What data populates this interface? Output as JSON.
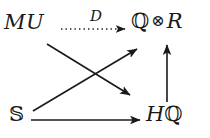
{
  "diagram": {
    "type": "commutative-diagram",
    "background_color": "#ffffff",
    "ink_color": "#1a1a1a",
    "nodes": [
      {
        "id": "mu",
        "label": "MU",
        "position": "top-left",
        "x": 4,
        "y": 12
      },
      {
        "id": "qr",
        "label_q": "ℚ",
        "label_tensor": "⊗",
        "label_r": "R",
        "label": "ℚ ⊗ R",
        "position": "top-right",
        "x": 131,
        "y": 11
      },
      {
        "id": "s",
        "label": "𝕊",
        "position": "bottom-left",
        "x": 9,
        "y": 104
      },
      {
        "id": "hq",
        "label_h": "H",
        "label_q": "ℚ",
        "label": "Hℚ",
        "position": "bottom-right",
        "x": 146,
        "y": 104
      }
    ],
    "edges": [
      {
        "id": "mu-to-qr",
        "from": "mu",
        "to": "qr",
        "label": "D",
        "style": "dotted",
        "arrowhead": "open",
        "label_x": 90,
        "label_y": 9
      },
      {
        "id": "mu-to-hq",
        "from": "mu",
        "to": "hq",
        "label": "",
        "style": "solid",
        "arrowhead": "open"
      },
      {
        "id": "s-to-qr",
        "from": "s",
        "to": "qr",
        "label": "",
        "style": "solid",
        "arrowhead": "open"
      },
      {
        "id": "s-to-hq",
        "from": "s",
        "to": "hq",
        "label": "",
        "style": "solid",
        "arrowhead": "open"
      },
      {
        "id": "hq-to-qr",
        "from": "hq",
        "to": "qr",
        "label": "",
        "style": "solid",
        "arrowhead": "open"
      }
    ]
  }
}
